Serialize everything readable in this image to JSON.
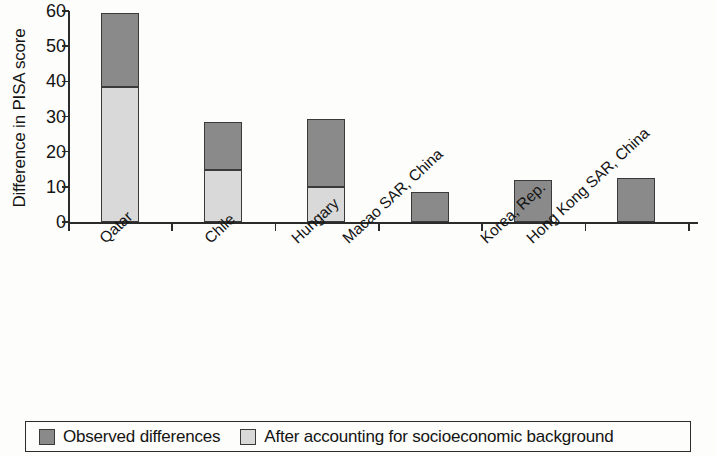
{
  "chart_data": {
    "type": "bar",
    "subtype": "stacked-vertical",
    "title": "",
    "xlabel": "",
    "ylabel": "Difference in PISA score",
    "ylim": [
      0,
      60
    ],
    "ytick_values": [
      0,
      10,
      20,
      30,
      40,
      50,
      60
    ],
    "ytick_labels": [
      "0",
      "10",
      "20",
      "30",
      "40",
      "50",
      "60"
    ],
    "grid": false,
    "categories": [
      "Qatar",
      "Chile",
      "Hungary",
      "Macao SAR, China",
      "Korea, Rep.",
      "Hong Kong SAR, China"
    ],
    "series": [
      {
        "name": "After accounting for socioeconomic background",
        "color": "#d9d9d9",
        "values": [
          38.5,
          14.8,
          10.0,
          0,
          0,
          0
        ]
      },
      {
        "name": "Observed differences",
        "color": "#8a8a8a",
        "values": [
          21.0,
          13.5,
          19.2,
          8.5,
          12.0,
          12.5
        ]
      }
    ],
    "totals": [
      59.5,
      28.3,
      29.2,
      8.5,
      12.0,
      12.5
    ],
    "legend_position": "bottom",
    "legend_entries": [
      {
        "label": "Observed differences",
        "swatch": "dark"
      },
      {
        "label": "After accounting for socioeconomic background",
        "swatch": "light"
      }
    ]
  },
  "colors": {
    "dark_gray": "#8a8a8a",
    "light_gray": "#d9d9d9",
    "axis": "#2b2b2b",
    "text": "#141414",
    "background": "#fdfdfb"
  }
}
